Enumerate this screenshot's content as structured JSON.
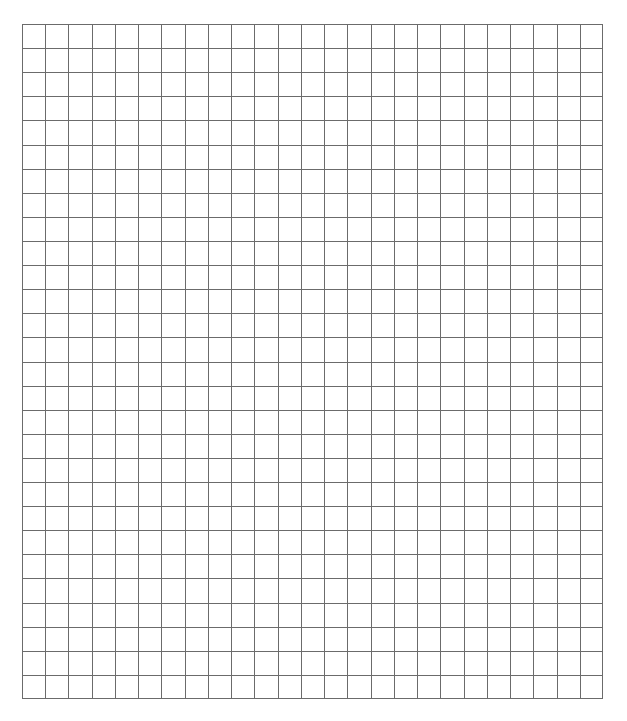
{
  "grid": {
    "columns": 25,
    "rows": 28,
    "line_color": "#6b6b6b",
    "background": "#ffffff",
    "left": 22,
    "top": 24,
    "width": 581,
    "height": 675
  }
}
